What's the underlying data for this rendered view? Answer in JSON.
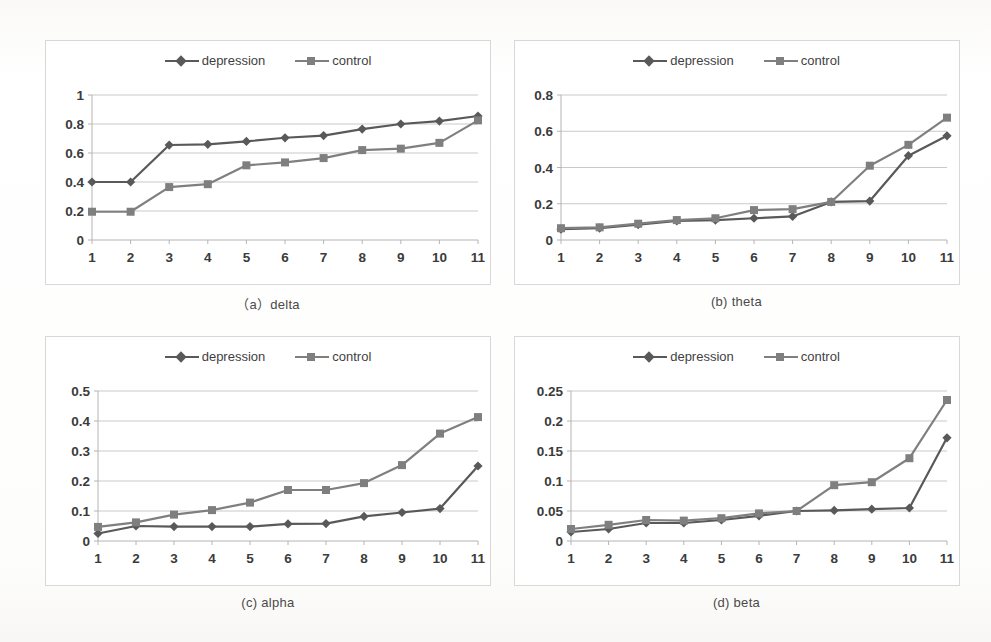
{
  "series_colors": {
    "depression": "#595959",
    "control": "#7f7f7f"
  },
  "legend": {
    "depression": "depression",
    "control": "control"
  },
  "charts": [
    {
      "key": "delta",
      "caption": "（a）delta",
      "chart_data": {
        "type": "line",
        "title": "",
        "xlabel": "",
        "ylabel": "",
        "categories": [
          "1",
          "2",
          "3",
          "4",
          "5",
          "6",
          "7",
          "8",
          "9",
          "10",
          "11"
        ],
        "x": [
          1,
          2,
          3,
          4,
          5,
          6,
          7,
          8,
          9,
          10,
          11
        ],
        "ylim": [
          0,
          1
        ],
        "yticks": [
          0,
          0.2,
          0.4,
          0.6,
          0.8,
          1
        ],
        "ytick_labels": [
          "0",
          "0.2",
          "0.4",
          "0.6",
          "0.8",
          "1"
        ],
        "grid": true,
        "legend_position": "top-center",
        "series": [
          {
            "name": "depression",
            "marker": "diamond",
            "values": [
              0.4,
              0.4,
              0.655,
              0.66,
              0.68,
              0.705,
              0.72,
              0.765,
              0.8,
              0.82,
              0.855
            ]
          },
          {
            "name": "control",
            "marker": "square",
            "values": [
              0.195,
              0.195,
              0.365,
              0.385,
              0.515,
              0.535,
              0.565,
              0.62,
              0.63,
              0.67,
              0.825
            ]
          }
        ]
      }
    },
    {
      "key": "theta",
      "caption": "(b) theta",
      "chart_data": {
        "type": "line",
        "title": "",
        "xlabel": "",
        "ylabel": "",
        "categories": [
          "1",
          "2",
          "3",
          "4",
          "5",
          "6",
          "7",
          "8",
          "9",
          "10",
          "11"
        ],
        "x": [
          1,
          2,
          3,
          4,
          5,
          6,
          7,
          8,
          9,
          10,
          11
        ],
        "ylim": [
          0,
          0.8
        ],
        "yticks": [
          0,
          0.2,
          0.4,
          0.6,
          0.8
        ],
        "ytick_labels": [
          "0",
          "0.2",
          "0.4",
          "0.6",
          "0.8"
        ],
        "grid": true,
        "legend_position": "top-center",
        "series": [
          {
            "name": "depression",
            "marker": "diamond",
            "values": [
              0.06,
              0.065,
              0.085,
              0.105,
              0.11,
              0.12,
              0.13,
              0.21,
              0.215,
              0.465,
              0.575
            ]
          },
          {
            "name": "control",
            "marker": "square",
            "values": [
              0.065,
              0.07,
              0.09,
              0.11,
              0.12,
              0.165,
              0.17,
              0.21,
              0.41,
              0.525,
              0.675
            ]
          }
        ]
      }
    },
    {
      "key": "alpha",
      "caption": "(c) alpha",
      "chart_data": {
        "type": "line",
        "title": "",
        "xlabel": "",
        "ylabel": "",
        "categories": [
          "1",
          "2",
          "3",
          "4",
          "5",
          "6",
          "7",
          "8",
          "9",
          "10",
          "11"
        ],
        "x": [
          1,
          2,
          3,
          4,
          5,
          6,
          7,
          8,
          9,
          10,
          11
        ],
        "ylim": [
          0,
          0.5
        ],
        "yticks": [
          0,
          0.1,
          0.2,
          0.3,
          0.4,
          0.5
        ],
        "ytick_labels": [
          "0",
          "0.1",
          "0.2",
          "0.3",
          "0.4",
          "0.5"
        ],
        "grid": true,
        "legend_position": "top-center",
        "series": [
          {
            "name": "depression",
            "marker": "diamond",
            "values": [
              0.025,
              0.05,
              0.048,
              0.048,
              0.048,
              0.057,
              0.058,
              0.082,
              0.095,
              0.108,
              0.25
            ]
          },
          {
            "name": "control",
            "marker": "square",
            "values": [
              0.047,
              0.062,
              0.088,
              0.103,
              0.128,
              0.17,
              0.17,
              0.193,
              0.253,
              0.358,
              0.413
            ]
          }
        ]
      }
    },
    {
      "key": "beta",
      "caption": "(d) beta",
      "chart_data": {
        "type": "line",
        "title": "",
        "xlabel": "",
        "ylabel": "",
        "categories": [
          "1",
          "2",
          "3",
          "4",
          "5",
          "6",
          "7",
          "8",
          "9",
          "10",
          "11"
        ],
        "x": [
          1,
          2,
          3,
          4,
          5,
          6,
          7,
          8,
          9,
          10,
          11
        ],
        "ylim": [
          0,
          0.25
        ],
        "yticks": [
          0,
          0.05,
          0.1,
          0.15,
          0.2,
          0.25
        ],
        "ytick_labels": [
          "0",
          "0.05",
          "0.1",
          "0.15",
          "0.2",
          "0.25"
        ],
        "grid": true,
        "legend_position": "top-center",
        "series": [
          {
            "name": "depression",
            "marker": "diamond",
            "values": [
              0.015,
              0.02,
              0.03,
              0.03,
              0.035,
              0.042,
              0.05,
              0.051,
              0.053,
              0.055,
              0.172
            ]
          },
          {
            "name": "control",
            "marker": "square",
            "values": [
              0.02,
              0.027,
              0.035,
              0.034,
              0.038,
              0.046,
              0.05,
              0.093,
              0.098,
              0.138,
              0.235
            ]
          }
        ]
      }
    }
  ]
}
